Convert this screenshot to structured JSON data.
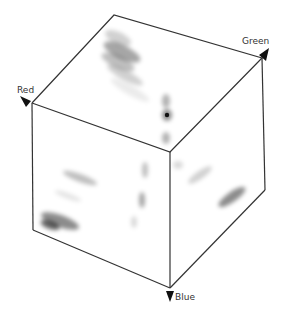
{
  "diagram": {
    "type": "rgb-color-cube-histogram",
    "axes": {
      "red": {
        "label": "Red"
      },
      "green": {
        "label": "Green"
      },
      "blue": {
        "label": "Blue"
      }
    },
    "colors": {
      "edge": "#333333",
      "background": "#ffffff",
      "density": "#000000"
    },
    "faces": [
      "top",
      "left-front",
      "right-front"
    ]
  }
}
